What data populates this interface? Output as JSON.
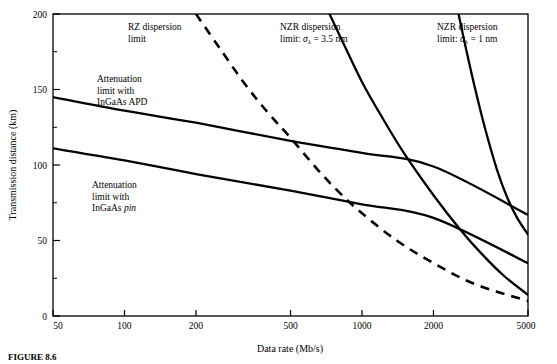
{
  "figure": {
    "caption": "FIGURE 8.6"
  },
  "annotations": [
    {
      "id": "rz-dispersion",
      "name": "annotation-rz-dispersion-limit",
      "line1": "RZ dispersion",
      "line2": "limit",
      "x": 128,
      "y": 22
    },
    {
      "id": "attenuation-apd",
      "name": "annotation-attenuation-limit-apd",
      "line1": "Attenuation",
      "line2": "limit with",
      "line3": "InGaAs APD",
      "x": 97,
      "y": 74
    },
    {
      "id": "attenuation-pin",
      "name": "annotation-attenuation-limit-pin",
      "line1": "Attenuation",
      "line2": "limit with",
      "line3_pre": "InGaAs ",
      "line3_em": "pin",
      "x": 92,
      "y": 180
    },
    {
      "id": "nzr-3p5",
      "name": "annotation-nzr-dispersion-limit-3p5nm",
      "line1": "NZR dispersion",
      "line2_pre": "limit: ",
      "line2_sym": "σ",
      "line2_sub": "λ",
      "line2_post": " = 3.5 nm",
      "x": 280,
      "y": 22
    },
    {
      "id": "nzr-1",
      "name": "annotation-nzr-dispersion-limit-1nm",
      "line1": "NZR dispersion",
      "line2_pre": "limit: ",
      "line2_sym": "σ",
      "line2_sub": "λ",
      "line2_post": " = 1 nm",
      "x": 437,
      "y": 22
    }
  ],
  "chart_data": {
    "type": "line",
    "title": "",
    "xlabel": "Data rate (Mb/s)",
    "ylabel": "Transmission distance (km)",
    "xscale": "log",
    "yscale": "linear",
    "xlim": [
      50,
      5000
    ],
    "ylim": [
      0,
      200
    ],
    "grid": false,
    "legend_position": "inline-annotations",
    "xticks": [
      50,
      100,
      200,
      500,
      1000,
      2000,
      5000
    ],
    "xtick_labels": [
      "50",
      "100",
      "200",
      "500",
      "1000",
      "2000",
      "5000"
    ],
    "yticks": [
      0,
      50,
      100,
      150,
      200
    ],
    "ytick_labels": [
      "0",
      "50",
      "100",
      "150",
      "200"
    ],
    "yticks_minor": [
      25,
      75,
      125,
      175
    ],
    "series": [
      {
        "name": "Attenuation limit with InGaAs APD",
        "style": "solid",
        "x": [
          50,
          100,
          200,
          500,
          1000,
          2000,
          5000
        ],
        "y": [
          145,
          136,
          128,
          116,
          108,
          99,
          67
        ]
      },
      {
        "name": "Attenuation limit with InGaAs pin",
        "style": "solid",
        "x": [
          50,
          100,
          200,
          500,
          1000,
          2000,
          5000
        ],
        "y": [
          111,
          103,
          94,
          83,
          74,
          65,
          35
        ]
      },
      {
        "name": "RZ dispersion limit",
        "style": "dashed",
        "x": [
          200,
          250,
          320,
          400,
          500,
          650,
          800,
          1000,
          1400,
          2000,
          3000,
          5000
        ],
        "y": [
          200,
          178,
          154,
          135,
          118,
          97,
          82,
          68,
          50,
          35,
          21,
          10
        ]
      },
      {
        "name": "NZR dispersion limit: sigma_lambda = 3.5 nm",
        "style": "solid",
        "x": [
          730,
          850,
          1000,
          1200,
          1500,
          2000,
          2600,
          3200,
          4000,
          5000
        ],
        "y": [
          200,
          178,
          155,
          133,
          108,
          80,
          57,
          41,
          26,
          14
        ]
      },
      {
        "name": "NZR dispersion limit: sigma_lambda = 1 nm",
        "style": "solid",
        "x": [
          2550,
          2750,
          3000,
          3300,
          3700,
          4100,
          4500,
          5000
        ],
        "y": [
          200,
          176,
          150,
          124,
          97,
          78,
          65,
          54
        ]
      }
    ]
  }
}
